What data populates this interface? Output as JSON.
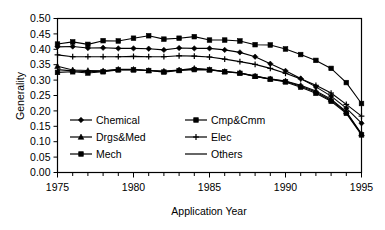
{
  "chart_data": {
    "type": "line",
    "title": "",
    "xlabel": "Application Year",
    "ylabel": "Generality",
    "xlim": [
      1975,
      1995
    ],
    "ylim": [
      0.0,
      0.5
    ],
    "grid": false,
    "legend_position": "inside-lower-left",
    "x": [
      1975,
      1976,
      1977,
      1978,
      1979,
      1980,
      1981,
      1982,
      1983,
      1984,
      1985,
      1986,
      1987,
      1988,
      1989,
      1990,
      1991,
      1992,
      1993,
      1994,
      1995
    ],
    "xticks": [
      1975,
      1980,
      1985,
      1990,
      1995
    ],
    "xtick_labels": [
      "1975",
      "1980",
      "1985",
      "1990",
      "1995"
    ],
    "yticks": [
      0.0,
      0.05,
      0.1,
      0.15,
      0.2,
      0.25,
      0.3,
      0.35,
      0.4,
      0.45,
      0.5
    ],
    "ytick_labels": [
      "0.00",
      "0.05",
      "0.10",
      "0.15",
      "0.20",
      "0.25",
      "0.30",
      "0.35",
      "0.40",
      "0.45",
      "0.50"
    ],
    "series": [
      {
        "name": "Chemical",
        "marker": "diamond",
        "values": [
          0.408,
          0.409,
          0.404,
          0.405,
          0.403,
          0.403,
          0.402,
          0.398,
          0.404,
          0.403,
          0.403,
          0.398,
          0.39,
          0.376,
          0.353,
          0.33,
          0.305,
          0.278,
          0.248,
          0.209,
          0.16
        ]
      },
      {
        "name": "Cmp&Cmm",
        "marker": "square",
        "values": [
          0.417,
          0.424,
          0.416,
          0.428,
          0.427,
          0.436,
          0.444,
          0.433,
          0.436,
          0.441,
          0.43,
          0.43,
          0.427,
          0.415,
          0.414,
          0.401,
          0.383,
          0.364,
          0.338,
          0.292,
          0.224
        ]
      },
      {
        "name": "Drgs&Med",
        "marker": "triangle",
        "values": [
          0.345,
          0.333,
          0.331,
          0.33,
          0.335,
          0.335,
          0.331,
          0.329,
          0.333,
          0.338,
          0.334,
          0.328,
          0.324,
          0.313,
          0.304,
          0.297,
          0.283,
          0.265,
          0.238,
          0.198,
          0.126
        ]
      },
      {
        "name": "Elec",
        "marker": "plus",
        "values": [
          0.382,
          0.376,
          0.376,
          0.376,
          0.376,
          0.377,
          0.376,
          0.376,
          0.379,
          0.378,
          0.375,
          0.368,
          0.36,
          0.351,
          0.338,
          0.322,
          0.304,
          0.283,
          0.258,
          0.221,
          0.183
        ]
      },
      {
        "name": "Mech",
        "marker": "square",
        "values": [
          0.325,
          0.327,
          0.323,
          0.327,
          0.333,
          0.333,
          0.331,
          0.326,
          0.331,
          0.334,
          0.333,
          0.327,
          0.322,
          0.312,
          0.303,
          0.294,
          0.277,
          0.257,
          0.231,
          0.192,
          0.122
        ]
      },
      {
        "name": "Others",
        "marker": "none",
        "values": [
          0.334,
          0.33,
          0.327,
          0.329,
          0.334,
          0.334,
          0.331,
          0.328,
          0.332,
          0.336,
          0.334,
          0.328,
          0.323,
          0.313,
          0.303,
          0.296,
          0.28,
          0.261,
          0.234,
          0.195,
          0.124
        ]
      }
    ]
  }
}
